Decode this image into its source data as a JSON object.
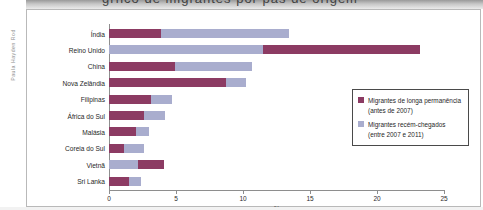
{
  "figure": {
    "credit": "Paula Hayden Rod",
    "title_strip_text": "grfico de migrantes por pas de origem"
  },
  "legend": {
    "items": [
      {
        "color": "#8c3b63",
        "label": "Migrantes de longa permanência (antes de 2007)"
      },
      {
        "color": "#a9adce",
        "label": "Migrantes recém-chegados (entre 2007 e 2011)"
      }
    ]
  },
  "chart_data": {
    "type": "bar",
    "orientation": "horizontal",
    "stacked": true,
    "title": "",
    "xlabel": "%",
    "ylabel": "",
    "xlim": [
      0,
      25
    ],
    "xticks": [
      0,
      5,
      10,
      15,
      20,
      25
    ],
    "xtick_labels": [
      "0",
      "5",
      "10",
      "15",
      "20",
      "25"
    ],
    "grid": false,
    "legend_position": "inside-right",
    "categories": [
      "Índia",
      "Reino Unido",
      "China",
      "Nova Zelândia",
      "Filipinas",
      "África do Sul",
      "Malásia",
      "Coreia do Sul",
      "Vietnã",
      "Sri Lanka"
    ],
    "series": [
      {
        "name": "Migrantes de longa permanência (antes de 2007)",
        "color": "#8c3b63",
        "values": [
          3.9,
          11.7,
          4.9,
          8.7,
          3.1,
          2.6,
          2.0,
          1.1,
          1.9,
          1.5
        ]
      },
      {
        "name": "Migrantes recém-chegados (entre 2007 e 2011)",
        "color": "#a9adce",
        "values": [
          9.5,
          11.5,
          5.8,
          1.5,
          1.6,
          1.6,
          1.0,
          1.5,
          2.2,
          0.9
        ]
      }
    ],
    "segment_order": [
      [
        "long",
        "new"
      ],
      [
        "new",
        "long"
      ],
      [
        "long",
        "new"
      ],
      [
        "long",
        "new"
      ],
      [
        "long",
        "new"
      ],
      [
        "long",
        "new"
      ],
      [
        "long",
        "new"
      ],
      [
        "long",
        "new"
      ],
      [
        "new",
        "long"
      ],
      [
        "long",
        "new"
      ]
    ],
    "totals": [
      13.4,
      23.2,
      10.7,
      10.2,
      4.7,
      4.2,
      3.0,
      2.6,
      4.1,
      2.4
    ]
  }
}
